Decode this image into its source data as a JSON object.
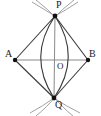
{
  "figure": {
    "type": "geometric-construction",
    "background_color": "#ffffff",
    "stroke_color": "#3a3a3a",
    "thin_stroke_color": "#8a8a8a",
    "point_color": "#111111",
    "label_color": "#1a1a1a",
    "width": 101,
    "height": 116
  },
  "points": [
    {
      "id": "P",
      "label": "P",
      "x": 55,
      "y": 16,
      "role": "arc-intersection-top"
    },
    {
      "id": "A",
      "label": "A",
      "x": 15,
      "y": 60,
      "role": "segment-endpoint-left"
    },
    {
      "id": "B",
      "label": "B",
      "x": 88,
      "y": 60,
      "role": "segment-endpoint-right"
    },
    {
      "id": "O",
      "label": "O",
      "x": 55,
      "y": 60,
      "role": "midpoint-center"
    },
    {
      "id": "Q",
      "label": "Q",
      "x": 54,
      "y": 98,
      "role": "arc-intersection-bottom"
    }
  ],
  "segments": [
    {
      "id": "AB",
      "from": "A",
      "to": "B",
      "style": "thin"
    },
    {
      "id": "PQ",
      "from": "P",
      "to": "Q",
      "style": "thin"
    },
    {
      "id": "AP",
      "from": "A",
      "to": "P",
      "style": "normal"
    },
    {
      "id": "PB",
      "from": "P",
      "to": "B",
      "style": "normal"
    },
    {
      "id": "BQ",
      "from": "B",
      "to": "Q",
      "style": "normal"
    },
    {
      "id": "QA",
      "from": "Q",
      "to": "A",
      "style": "normal"
    }
  ],
  "arcs": [
    {
      "id": "lens-left",
      "center": "B",
      "through": [
        "P",
        "Q"
      ],
      "style": "normal"
    },
    {
      "id": "lens-right",
      "center": "A",
      "through": [
        "P",
        "Q"
      ],
      "style": "normal"
    },
    {
      "id": "construction-top-left",
      "center": "A",
      "style": "thin"
    },
    {
      "id": "construction-top-right",
      "center": "B",
      "style": "thin"
    },
    {
      "id": "construction-bottom-left",
      "center": "A",
      "style": "thin"
    },
    {
      "id": "construction-bottom-right",
      "center": "B",
      "style": "thin"
    }
  ],
  "labels": {
    "p": "P",
    "a": "A",
    "b": "B",
    "o": "O",
    "q": "Q"
  }
}
